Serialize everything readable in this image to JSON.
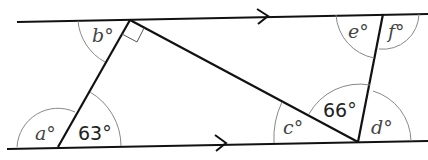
{
  "diagram": {
    "parallel_lines": {
      "top": {
        "arrow": "right"
      },
      "bottom": {
        "arrow": "right"
      }
    },
    "angles": {
      "a": {
        "label": "a°"
      },
      "given_63": {
        "label": "63°"
      },
      "b": {
        "label": "b°"
      },
      "c": {
        "label": "c°"
      },
      "given_66": {
        "label": "66°"
      },
      "d": {
        "label": "d°"
      },
      "e": {
        "label": "e°"
      },
      "f": {
        "label": "f°"
      }
    },
    "right_angle_marker": "at top vertex of triangle",
    "colors": {
      "line": "#111111",
      "arc": "#888888",
      "text": "#333333"
    }
  }
}
